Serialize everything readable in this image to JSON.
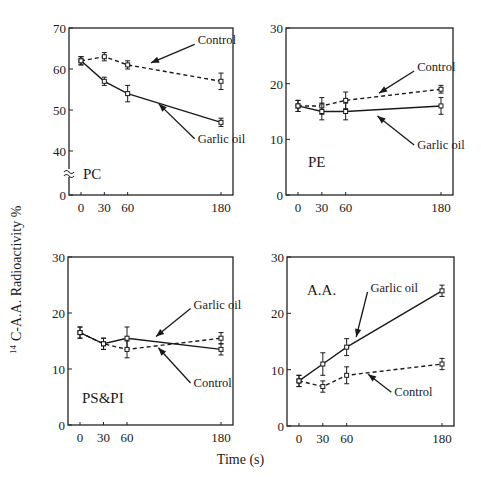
{
  "figure": {
    "ylabel_sup": "14",
    "ylabel": "C-A.A. Radioactivity %",
    "xlabel": "Time (s)"
  },
  "chart_data": [
    {
      "type": "line",
      "panel": "PC",
      "title": "PC",
      "xlabel": "Time (s)",
      "ylabel": "14 C-A.A. Radioactivity %",
      "x": [
        0,
        30,
        60,
        180
      ],
      "x_ticks": [
        "0",
        "30",
        "60",
        "180"
      ],
      "y_ticks": [
        "0",
        "40",
        "50",
        "60",
        "70"
      ],
      "ylim": [
        0,
        70
      ],
      "axis_break": true,
      "break_between": [
        0,
        40
      ],
      "series": [
        {
          "name": "Control",
          "style": "dashed",
          "values": [
            62,
            63,
            61,
            57
          ],
          "errors": [
            1,
            1,
            1,
            2
          ]
        },
        {
          "name": "Garlic oil",
          "style": "solid",
          "values": [
            62,
            57,
            54,
            47
          ],
          "errors": [
            1,
            1,
            2,
            1
          ]
        }
      ],
      "annotations": [
        {
          "text": "Control",
          "x": 150,
          "y": 67,
          "arrow_to_x": 90,
          "arrow_to_y": 61.5
        },
        {
          "text": "Garlic oil",
          "x": 150,
          "y": 43,
          "arrow_to_x": 100,
          "arrow_to_y": 51.5
        }
      ],
      "grid": false
    },
    {
      "type": "line",
      "panel": "PE",
      "title": "PE",
      "x": [
        0,
        30,
        60,
        180
      ],
      "x_ticks": [
        "0",
        "30",
        "60",
        "180"
      ],
      "y_ticks": [
        "0",
        "10",
        "20",
        "30"
      ],
      "ylim": [
        0,
        30
      ],
      "series": [
        {
          "name": "Control",
          "style": "dashed",
          "values": [
            16,
            16,
            17,
            19
          ],
          "errors": [
            1,
            1.5,
            1.5,
            0.7
          ]
        },
        {
          "name": "Garlic oil",
          "style": "solid",
          "values": [
            16,
            15,
            15,
            16
          ],
          "errors": [
            1,
            1.5,
            1.5,
            1.5
          ]
        }
      ],
      "annotations": [
        {
          "text": "Control",
          "x": 150,
          "y": 23,
          "arrow_to_x": 102,
          "arrow_to_y": 18.3
        },
        {
          "text": "Garlic oil",
          "x": 150,
          "y": 9,
          "arrow_to_x": 100,
          "arrow_to_y": 14.2
        }
      ],
      "grid": false
    },
    {
      "type": "line",
      "panel": "PS&PI",
      "title": "PS&PI",
      "x": [
        0,
        30,
        60,
        180
      ],
      "x_ticks": [
        "0",
        "30",
        "60",
        "180"
      ],
      "y_ticks": [
        "0",
        "10",
        "20",
        "30"
      ],
      "ylim": [
        0,
        30
      ],
      "series": [
        {
          "name": "Garlic oil",
          "style": "solid",
          "values": [
            16.5,
            14.5,
            15.5,
            13.5
          ],
          "errors": [
            1,
            1,
            2,
            1
          ]
        },
        {
          "name": "Control",
          "style": "dashed",
          "values": [
            16.5,
            14.5,
            13.5,
            15.5
          ],
          "errors": [
            1,
            1,
            1.5,
            1
          ]
        }
      ],
      "annotations": [
        {
          "text": "Garlic oil",
          "x": 145,
          "y": 21.5,
          "arrow_to_x": 97,
          "arrow_to_y": 15.8
        },
        {
          "text": "Control",
          "x": 145,
          "y": 7.5,
          "arrow_to_x": 100,
          "arrow_to_y": 13.8
        }
      ],
      "grid": false
    },
    {
      "type": "line",
      "panel": "A.A.",
      "title": "A.A.",
      "x": [
        0,
        30,
        60,
        180
      ],
      "x_ticks": [
        "0",
        "30",
        "60",
        "180"
      ],
      "y_ticks": [
        "0",
        "10",
        "20",
        "30"
      ],
      "ylim": [
        0,
        30
      ],
      "series": [
        {
          "name": "Garlic oil",
          "style": "solid",
          "values": [
            8,
            11,
            14,
            24
          ],
          "errors": [
            1,
            2,
            1.5,
            1
          ]
        },
        {
          "name": "Control",
          "style": "dashed",
          "values": [
            8,
            7,
            9,
            11
          ],
          "errors": [
            1,
            1,
            1.5,
            1
          ]
        }
      ],
      "annotations": [
        {
          "text": "Garlic oil",
          "x": 90,
          "y": 24.5,
          "arrow_to_x": 72,
          "arrow_to_y": 15.8
        },
        {
          "text": "Control",
          "x": 120,
          "y": 6,
          "arrow_to_x": 87,
          "arrow_to_y": 9.2
        }
      ],
      "grid": false
    }
  ],
  "panels_layout": [
    {
      "left": 69,
      "top": 28,
      "right": 233,
      "bottom": 195
    },
    {
      "left": 286,
      "top": 28,
      "right": 453,
      "bottom": 195
    },
    {
      "left": 68,
      "top": 257,
      "right": 233,
      "bottom": 425
    },
    {
      "left": 287,
      "top": 257,
      "right": 454,
      "bottom": 426
    }
  ]
}
